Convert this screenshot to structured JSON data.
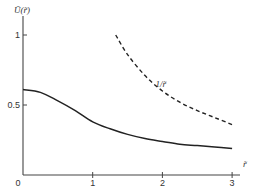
{
  "chart_data": {
    "type": "line",
    "title": "",
    "xlabel": "r̃",
    "ylabel": "Ũ(r̃)",
    "xlim": [
      0,
      3.2
    ],
    "ylim": [
      0,
      1.2
    ],
    "xticks": [
      0,
      1,
      2,
      3
    ],
    "xtick_labels": [
      "0",
      "1",
      "2",
      "3"
    ],
    "yticks": [
      0.5,
      1
    ],
    "ytick_labels": [
      "0.5",
      "1"
    ],
    "grid": false,
    "series": [
      {
        "name": "Ũ(r̃)",
        "style": "solid",
        "x": [
          0,
          0.25,
          0.5,
          0.75,
          1.0,
          1.25,
          1.5,
          1.75,
          2.0,
          2.25,
          2.5,
          2.75,
          3.0
        ],
        "y": [
          0.61,
          0.59,
          0.53,
          0.46,
          0.38,
          0.33,
          0.29,
          0.26,
          0.24,
          0.22,
          0.21,
          0.2,
          0.19
        ]
      },
      {
        "name": "1/r̃",
        "style": "dashed",
        "x": [
          1.33,
          1.5,
          1.75,
          2.0,
          2.25,
          2.5,
          2.75,
          3.0
        ],
        "y": [
          1.0,
          0.86,
          0.71,
          0.6,
          0.52,
          0.46,
          0.41,
          0.36
        ]
      }
    ],
    "annotations": [
      {
        "text": "1/r̃",
        "x": 1.9,
        "y": 0.63
      }
    ]
  },
  "labels": {
    "ylabel": "Ũ(r̃)",
    "xlabel": "r̃",
    "origin": "0",
    "curve_label": "1/r̃"
  }
}
